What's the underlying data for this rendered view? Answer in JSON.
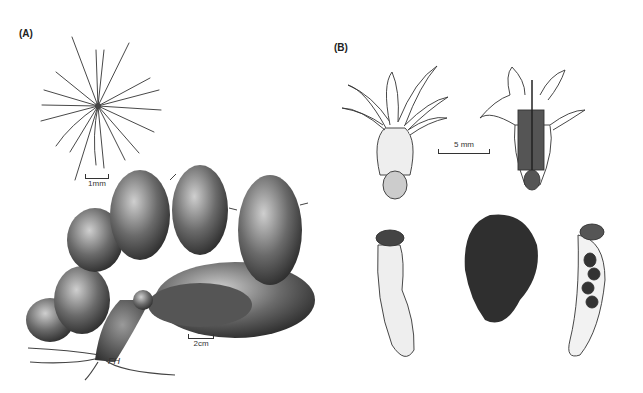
{
  "figure": {
    "panels": [
      {
        "label": "(A)",
        "items": [
          {
            "name": "spine-cluster",
            "scale_label": "1mm"
          },
          {
            "name": "cactus-plant",
            "scale_label": "2cm"
          }
        ]
      },
      {
        "label": "(B)",
        "items": [
          {
            "name": "flower-whole"
          },
          {
            "name": "flower-longitudinal-section"
          },
          {
            "name": "fruit-whole"
          },
          {
            "name": "seed"
          },
          {
            "name": "fruit-section"
          }
        ],
        "scale_label": "5 mm"
      }
    ],
    "signature": "FH"
  }
}
